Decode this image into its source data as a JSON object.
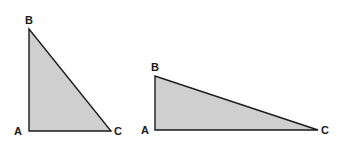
{
  "diagram": {
    "fill_color": "#cfcfcf",
    "stroke_color": "#1a1a1a",
    "triangles": [
      {
        "name": "left-triangle",
        "vertices": {
          "A": {
            "label": "A",
            "x": 29,
            "y": 131
          },
          "B": {
            "label": "B",
            "x": 29,
            "y": 29
          },
          "C": {
            "label": "C",
            "x": 111,
            "y": 131
          }
        }
      },
      {
        "name": "right-triangle",
        "vertices": {
          "A": {
            "label": "A",
            "x": 155,
            "y": 130
          },
          "B": {
            "label": "B",
            "x": 155,
            "y": 76
          },
          "C": {
            "label": "C",
            "x": 318,
            "y": 130
          }
        }
      }
    ]
  }
}
